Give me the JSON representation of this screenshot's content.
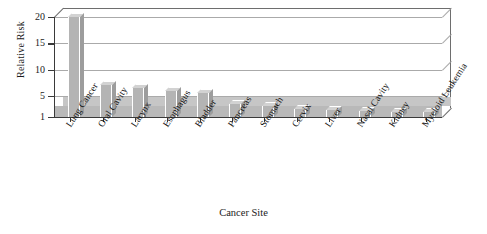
{
  "chart_data": {
    "type": "bar",
    "title": "",
    "xlabel": "Cancer Site",
    "ylabel": "Relative Risk",
    "categories": [
      "Lung Cancer",
      "Oral Cavity",
      "Larynx",
      "Esophagus",
      "Bladder",
      "Pancreas",
      "Stomach",
      "Cervix",
      "Liver",
      "Nasal Cavity",
      "Kidney",
      "Myeloid Leukemia"
    ],
    "values": [
      20.0,
      7.0,
      6.5,
      6.0,
      5.5,
      3.5,
      3.0,
      2.6,
      2.3,
      2.1,
      1.9,
      1.9
    ],
    "ylim": [
      1,
      20
    ],
    "yticks": [
      1,
      5,
      10,
      15,
      20
    ],
    "ytick_labels": [
      "1",
      "5",
      "10",
      "15",
      "20"
    ],
    "grid": true,
    "grid_axis": "y",
    "legend": false,
    "bar_color": "#b4b4b4",
    "bar_top_color": "#d2d2d2",
    "bar_side_color": "#9d9d9d",
    "axis_color": "#3a3a3a",
    "grid_color": "#9b9b9b",
    "background": "#ffffff",
    "style": "3d-bar-grayscale"
  }
}
